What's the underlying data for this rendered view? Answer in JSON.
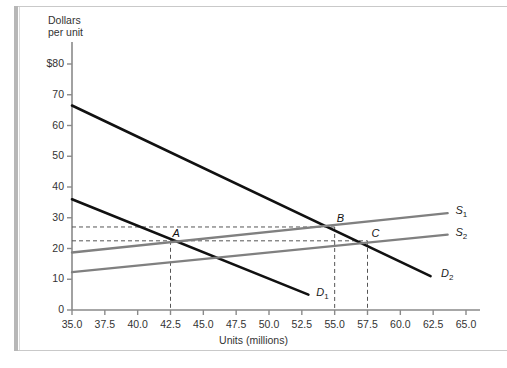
{
  "figure": {
    "y_axis_title": "Dollars\nper unit",
    "x_axis_title": "Units (millions)"
  },
  "colors": {
    "demand": "#111111",
    "supply": "#808080",
    "axis": "#8a8a8a",
    "dashed": "#555555",
    "frame": "#c9c9c9",
    "frame_bar": "#b7b7b7"
  },
  "chart_data": {
    "type": "line",
    "title": "",
    "xlabel": "Units (millions)",
    "ylabel": "Dollars per unit",
    "xlim": [
      35.0,
      65.0
    ],
    "ylim": [
      0,
      80
    ],
    "grid": false,
    "legend": "inline-right",
    "x_ticks": [
      "35.0",
      "37.5",
      "40.0",
      "42.5",
      "45.0",
      "47.5",
      "50.0",
      "52.5",
      "55.0",
      "57.5",
      "60.0",
      "62.5",
      "65.0"
    ],
    "y_ticks": [
      "0",
      "10",
      "20",
      "30",
      "40",
      "50",
      "60",
      "70",
      "$80"
    ],
    "series": [
      {
        "name": "D1",
        "label": "D",
        "sub": "1",
        "kind": "demand",
        "color": "#111111",
        "points": [
          [
            35.0,
            36.0
          ],
          [
            53.0,
            5.0
          ]
        ],
        "label_at": [
          53.6,
          5.0
        ]
      },
      {
        "name": "D2",
        "label": "D",
        "sub": "2",
        "kind": "demand",
        "color": "#111111",
        "points": [
          [
            35.0,
            66.5
          ],
          [
            62.3,
            11.0
          ]
        ],
        "label_at": [
          63.1,
          11.0
        ]
      },
      {
        "name": "S1",
        "label": "S",
        "sub": "1",
        "kind": "supply",
        "color": "#808080",
        "points": [
          [
            35.0,
            18.7
          ],
          [
            63.6,
            31.5
          ]
        ],
        "label_at": [
          64.2,
          31.5
        ]
      },
      {
        "name": "S2",
        "label": "S",
        "sub": "2",
        "kind": "supply",
        "color": "#808080",
        "points": [
          [
            35.0,
            12.3
          ],
          [
            63.6,
            24.5
          ]
        ],
        "label_at": [
          64.2,
          24.5
        ]
      }
    ],
    "points": [
      {
        "name": "A",
        "label": "A",
        "x": 42.5,
        "y": 22.5,
        "label_dx": 2,
        "label_dy": -14
      },
      {
        "name": "B",
        "label": "B",
        "x": 55.0,
        "y": 27.0,
        "label_dx": 2,
        "label_dy": -15
      },
      {
        "name": "C",
        "label": "C",
        "x": 57.5,
        "y": 22.5,
        "label_dx": 4,
        "label_dy": -14
      }
    ],
    "guide_lines": {
      "horizontal": [
        27.0,
        22.5
      ],
      "vertical": [
        42.5,
        55.0,
        57.5
      ]
    },
    "annotations": []
  }
}
